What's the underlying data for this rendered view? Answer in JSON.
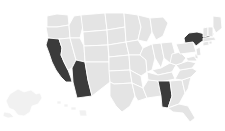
{
  "map": {
    "title": "United States state map",
    "type": "choropleth",
    "projection": "albers-usa",
    "background_color": "#ffffff",
    "default_state_color": "#e4e4e4",
    "selected_state_color": "#3b3b3b",
    "border_color": "#ffffff",
    "inset_color": "#ededed",
    "legend_visible": false,
    "labels_visible": false,
    "selected_count": 4,
    "selected_states": [
      "California",
      "Arizona",
      "Alabama",
      "New York"
    ],
    "insets": [
      {
        "name": "Alaska",
        "selected": false
      },
      {
        "name": "Hawaii",
        "selected": false
      }
    ],
    "states": [
      {
        "code": "WA",
        "name": "Washington",
        "selected": false
      },
      {
        "code": "OR",
        "name": "Oregon",
        "selected": false
      },
      {
        "code": "CA",
        "name": "California",
        "selected": true
      },
      {
        "code": "NV",
        "name": "Nevada",
        "selected": false
      },
      {
        "code": "ID",
        "name": "Idaho",
        "selected": false
      },
      {
        "code": "MT",
        "name": "Montana",
        "selected": false
      },
      {
        "code": "WY",
        "name": "Wyoming",
        "selected": false
      },
      {
        "code": "UT",
        "name": "Utah",
        "selected": false
      },
      {
        "code": "AZ",
        "name": "Arizona",
        "selected": true
      },
      {
        "code": "CO",
        "name": "Colorado",
        "selected": false
      },
      {
        "code": "NM",
        "name": "New Mexico",
        "selected": false
      },
      {
        "code": "ND",
        "name": "North Dakota",
        "selected": false
      },
      {
        "code": "SD",
        "name": "South Dakota",
        "selected": false
      },
      {
        "code": "NE",
        "name": "Nebraska",
        "selected": false
      },
      {
        "code": "KS",
        "name": "Kansas",
        "selected": false
      },
      {
        "code": "OK",
        "name": "Oklahoma",
        "selected": false
      },
      {
        "code": "TX",
        "name": "Texas",
        "selected": false
      },
      {
        "code": "MN",
        "name": "Minnesota",
        "selected": false
      },
      {
        "code": "IA",
        "name": "Iowa",
        "selected": false
      },
      {
        "code": "MO",
        "name": "Missouri",
        "selected": false
      },
      {
        "code": "AR",
        "name": "Arkansas",
        "selected": false
      },
      {
        "code": "LA",
        "name": "Louisiana",
        "selected": false
      },
      {
        "code": "WI",
        "name": "Wisconsin",
        "selected": false
      },
      {
        "code": "IL",
        "name": "Illinois",
        "selected": false
      },
      {
        "code": "MI",
        "name": "Michigan",
        "selected": false
      },
      {
        "code": "IN",
        "name": "Indiana",
        "selected": false
      },
      {
        "code": "OH",
        "name": "Ohio",
        "selected": false
      },
      {
        "code": "KY",
        "name": "Kentucky",
        "selected": false
      },
      {
        "code": "TN",
        "name": "Tennessee",
        "selected": false
      },
      {
        "code": "MS",
        "name": "Mississippi",
        "selected": false
      },
      {
        "code": "AL",
        "name": "Alabama",
        "selected": true
      },
      {
        "code": "GA",
        "name": "Georgia",
        "selected": false
      },
      {
        "code": "FL",
        "name": "Florida",
        "selected": false
      },
      {
        "code": "SC",
        "name": "South Carolina",
        "selected": false
      },
      {
        "code": "NC",
        "name": "North Carolina",
        "selected": false
      },
      {
        "code": "VA",
        "name": "Virginia",
        "selected": false
      },
      {
        "code": "WV",
        "name": "West Virginia",
        "selected": false
      },
      {
        "code": "MD",
        "name": "Maryland",
        "selected": false
      },
      {
        "code": "DE",
        "name": "Delaware",
        "selected": false
      },
      {
        "code": "PA",
        "name": "Pennsylvania",
        "selected": false
      },
      {
        "code": "NJ",
        "name": "New Jersey",
        "selected": false
      },
      {
        "code": "NY",
        "name": "New York",
        "selected": true
      },
      {
        "code": "CT",
        "name": "Connecticut",
        "selected": false
      },
      {
        "code": "RI",
        "name": "Rhode Island",
        "selected": false
      },
      {
        "code": "MA",
        "name": "Massachusetts",
        "selected": false
      },
      {
        "code": "VT",
        "name": "Vermont",
        "selected": false
      },
      {
        "code": "NH",
        "name": "New Hampshire",
        "selected": false
      },
      {
        "code": "ME",
        "name": "Maine",
        "selected": false
      }
    ]
  }
}
